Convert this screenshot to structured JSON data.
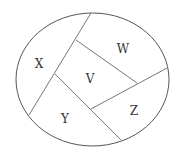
{
  "diagram": {
    "type": "region-partition",
    "outline": "ellipse",
    "stroke_color": "#555555",
    "regions": [
      {
        "id": "X",
        "label": "X",
        "x": 39,
        "y": 64
      },
      {
        "id": "W",
        "label": "W",
        "x": 123,
        "y": 51
      },
      {
        "id": "V",
        "label": "V",
        "x": 90,
        "y": 81
      },
      {
        "id": "Y",
        "label": "Y",
        "x": 65,
        "y": 122
      },
      {
        "id": "Z",
        "label": "Z",
        "x": 134,
        "y": 114
      }
    ]
  }
}
